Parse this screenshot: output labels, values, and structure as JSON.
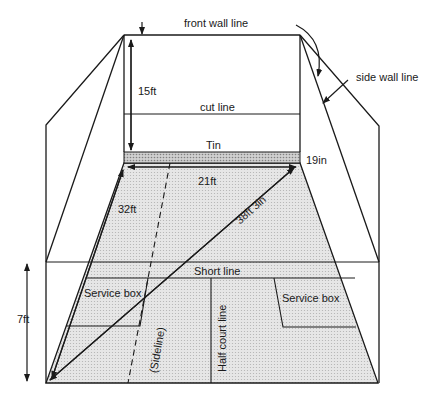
{
  "colors": {
    "line": "#1a1a1a",
    "floor_fill": "#dcdcdc",
    "tin_fill": "#b8b8b8",
    "background": "#ffffff"
  },
  "labels": {
    "front_wall_line": "front wall line",
    "side_wall_line": "side wall line",
    "front_wall_height": "15ft",
    "cut_line": "cut line",
    "tin": "Tin",
    "tin_height": "19in",
    "court_width": "21ft",
    "court_length": "32ft",
    "diagonal": "38ft 3in",
    "short_line": "Short line",
    "service_box_left": "Service box",
    "service_box_right": "Service box",
    "sideline": "(Sideline)",
    "half_court_line": "Half court line",
    "back_wall_height": "7ft"
  }
}
